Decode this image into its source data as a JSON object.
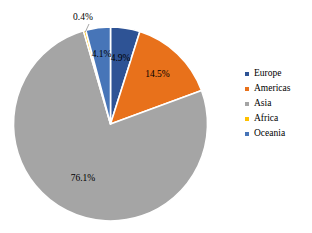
{
  "chart_data": {
    "type": "pie",
    "title": "",
    "subtitle": "",
    "xlabel": "",
    "ylabel": "",
    "categories": [
      "Europe",
      "Americas",
      "Asia",
      "Africa",
      "Oceania"
    ],
    "values": [
      4.9,
      14.5,
      76.1,
      0.4,
      4.1
    ],
    "value_unit": "%",
    "data_labels": [
      "4.9%",
      "14.5%",
      "76.1%",
      "0.4%",
      "4.1%"
    ],
    "colors": [
      "#2E5395",
      "#E8711B",
      "#A5A5A5",
      "#FFC000",
      "#4775B8"
    ],
    "slice_order": "clockwise",
    "start_angle_deg": 0,
    "legend": {
      "position": "right",
      "entries": [
        {
          "label": "Europe",
          "color": "#2E5395"
        },
        {
          "label": "Americas",
          "color": "#E8711B"
        },
        {
          "label": "Asia",
          "color": "#A5A5A5"
        },
        {
          "label": "Africa",
          "color": "#FFC000"
        },
        {
          "label": "Oceania",
          "color": "#4775B8"
        }
      ]
    },
    "grid": false,
    "separator_color": "#FFFFFF",
    "background_color": "#FFFFFF"
  },
  "labels": {
    "europe": "4.9%",
    "americas": "14.5%",
    "asia": "76.1%",
    "africa": "0.4%",
    "oceania": "4.1%"
  },
  "legend": {
    "items": [
      {
        "label": "Europe"
      },
      {
        "label": "Americas"
      },
      {
        "label": "Asia"
      },
      {
        "label": "Africa"
      },
      {
        "label": "Oceania"
      }
    ]
  }
}
